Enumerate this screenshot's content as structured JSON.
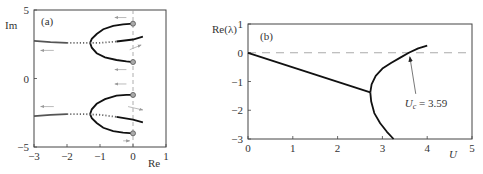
{
  "chart_data": [
    {
      "type": "scatter",
      "panel_label": "(a)",
      "title": "",
      "xlabel": "Re",
      "ylabel": "Im",
      "xlim": [
        -3,
        1
      ],
      "ylim": [
        -5,
        5
      ],
      "xticks": [
        -3,
        -2,
        -1,
        0,
        1
      ],
      "yticks": [
        -5,
        0,
        5
      ],
      "xtick_labels": [
        "−3",
        "−2",
        "−1",
        "0",
        "1"
      ],
      "ytick_labels": [
        "−5",
        "0",
        "5"
      ],
      "reference_line": {
        "orientation": "vertical",
        "x": 0,
        "style": "dashed"
      },
      "series": [
        {
          "name": "upper-outer-branch",
          "style": "solid",
          "points": [
            [
              0,
              4.0
            ],
            [
              -0.3,
              3.95
            ],
            [
              -0.6,
              3.85
            ],
            [
              -0.9,
              3.6
            ],
            [
              -1.1,
              3.25
            ],
            [
              -1.25,
              2.9
            ],
            [
              -1.3,
              2.6
            ]
          ]
        },
        {
          "name": "upper-inner-branch",
          "style": "solid",
          "points": [
            [
              -1.3,
              2.6
            ],
            [
              -1.25,
              2.25
            ],
            [
              -1.1,
              1.85
            ],
            [
              -0.85,
              1.55
            ],
            [
              -0.5,
              1.35
            ],
            [
              -0.2,
              1.25
            ],
            [
              0,
              1.2
            ]
          ]
        },
        {
          "name": "upper-horizontal-branch",
          "style": "dotted-to-solid",
          "points": [
            [
              -3,
              2.75
            ],
            [
              -2.5,
              2.65
            ],
            [
              -2.0,
              2.6
            ],
            [
              -1.5,
              2.6
            ],
            [
              -1.0,
              2.6
            ],
            [
              -0.5,
              2.7
            ],
            [
              0,
              2.85
            ],
            [
              0.3,
              3.05
            ]
          ]
        },
        {
          "name": "lower-inner-branch",
          "style": "solid",
          "points": [
            [
              0,
              -1.2
            ],
            [
              -0.2,
              -1.2
            ],
            [
              -0.5,
              -1.25
            ],
            [
              -0.85,
              -1.5
            ],
            [
              -1.1,
              -1.85
            ],
            [
              -1.25,
              -2.25
            ],
            [
              -1.3,
              -2.6
            ]
          ]
        },
        {
          "name": "lower-outer-branch",
          "style": "solid",
          "points": [
            [
              -1.3,
              -2.6
            ],
            [
              -1.25,
              -2.9
            ],
            [
              -1.1,
              -3.25
            ],
            [
              -0.9,
              -3.6
            ],
            [
              -0.6,
              -3.85
            ],
            [
              -0.3,
              -3.95
            ],
            [
              0,
              -4.0
            ]
          ]
        },
        {
          "name": "lower-horizontal-branch",
          "style": "dotted-to-solid",
          "points": [
            [
              -3,
              -2.75
            ],
            [
              -2.5,
              -2.65
            ],
            [
              -2.0,
              -2.6
            ],
            [
              -1.5,
              -2.6
            ],
            [
              -1.0,
              -2.65
            ],
            [
              -0.5,
              -2.8
            ],
            [
              0,
              -3.0
            ],
            [
              0.3,
              -3.2
            ]
          ]
        }
      ],
      "endpoints": [
        [
          0,
          4.0
        ],
        [
          0,
          1.2
        ],
        [
          0,
          -1.2
        ],
        [
          0,
          -4.0
        ]
      ],
      "arrows": [
        {
          "from": [
            -0.2,
            4.45
          ],
          "to": [
            -0.55,
            4.45
          ]
        },
        {
          "from": [
            -2.4,
            2.05
          ],
          "to": [
            -2.8,
            2.05
          ]
        },
        {
          "from": [
            -0.1,
            2.1
          ],
          "to": [
            0.25,
            2.45
          ]
        },
        {
          "from": [
            -0.2,
            0.65
          ],
          "to": [
            -0.55,
            0.65
          ]
        },
        {
          "from": [
            -0.2,
            -0.4
          ],
          "to": [
            -0.55,
            -0.4
          ]
        },
        {
          "from": [
            -2.4,
            -2.05
          ],
          "to": [
            -2.8,
            -2.05
          ]
        },
        {
          "from": [
            -0.15,
            -2.05
          ],
          "to": [
            0.3,
            -2.3
          ]
        },
        {
          "from": [
            -0.3,
            -4.55
          ],
          "to": [
            -0.1,
            -4.55
          ]
        }
      ]
    },
    {
      "type": "line",
      "panel_label": "(b)",
      "title": "",
      "xlabel": "U",
      "ylabel": "Re(λ)",
      "xlim": [
        0,
        5
      ],
      "ylim": [
        -3,
        1
      ],
      "xticks": [
        0,
        1,
        2,
        3,
        4,
        5
      ],
      "yticks": [
        1,
        0,
        -1,
        -2,
        -3
      ],
      "xtick_labels": [
        "0",
        "1",
        "2",
        "3",
        "4",
        "5"
      ],
      "ytick_labels": [
        "1",
        "0",
        "−1",
        "−2",
        "−3"
      ],
      "reference_line": {
        "orientation": "horizontal",
        "y": 0,
        "style": "dashed"
      },
      "series": [
        {
          "name": "linear-branch",
          "x": [
            0,
            2.73
          ],
          "y": [
            0,
            -1.38
          ]
        },
        {
          "name": "upper-branch",
          "x": [
            2.73,
            2.76,
            2.85,
            3.0,
            3.2,
            3.4,
            3.59,
            3.8,
            4.0
          ],
          "y": [
            -1.38,
            -1.1,
            -0.8,
            -0.55,
            -0.35,
            -0.17,
            0,
            0.15,
            0.25
          ]
        },
        {
          "name": "lower-branch",
          "x": [
            2.73,
            2.75,
            2.82,
            2.95,
            3.1,
            3.25
          ],
          "y": [
            -1.38,
            -1.7,
            -2.1,
            -2.45,
            -2.75,
            -3.0
          ]
        }
      ],
      "annotation": {
        "text_main": "U",
        "text_sub": "c",
        "text_value": " = 3.59",
        "points_to": [
          3.59,
          0
        ],
        "text_at": [
          3.7,
          -1.5
        ]
      }
    }
  ]
}
